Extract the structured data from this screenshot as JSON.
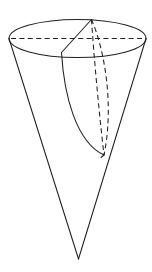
{
  "figure": {
    "title": "Cone with inscribed wedge",
    "background_color": "#ffffff",
    "line_color": "#221f1f",
    "line_width": 1.05,
    "dash_pattern": "5 3.4",
    "canvas": {
      "width": 152,
      "height": 272
    }
  },
  "geometry": {
    "top_ellipse": {
      "name": "cone-top-rim",
      "center_x": 77.5,
      "center_y": 38.5,
      "radius_x": 68.5,
      "radius_y": 19.0,
      "visible_front_arc": "solid",
      "visible_back_arc": "solid"
    },
    "apex": {
      "name": "cone-apex",
      "x": 78.5,
      "y": 259.0
    },
    "left_rim_point": {
      "x": 9.0,
      "y": 38.5
    },
    "right_rim_point": {
      "x": 146.0,
      "y": 38.5
    },
    "major_axis_dashed": {
      "name": "rim-diameter",
      "x1": 11.0,
      "y1": 38.5,
      "x2": 144.0,
      "y2": 38.5
    },
    "wedge": {
      "top_vertex": {
        "name": "wedge-top-vertex",
        "x": 91.5,
        "y": 19.5
      },
      "front_rim_vertex": {
        "name": "wedge-front-rim-vertex",
        "x": 61.5,
        "y": 52.5
      },
      "bottom_vertex": {
        "name": "wedge-bottom-vertex",
        "x": 104.0,
        "y": 155.0
      },
      "visible_straight_edge": "from top vertex to front rim vertex",
      "visible_curved_edge": "from front rim vertex curving down to bottom vertex",
      "hidden_edges": [
        "top vertex to bottom vertex (left dashed)",
        "top vertex to bottom vertex (right dashed, bowed)"
      ]
    },
    "cone_sides": {
      "left_slant": {
        "x1": 9.0,
        "y1": 38.5,
        "x2": 78.5,
        "y2": 259.0
      },
      "right_slant": {
        "x1": 146.0,
        "y1": 38.5,
        "x2": 78.5,
        "y2": 259.0
      }
    }
  },
  "labels": {
    "count": 0,
    "items": []
  }
}
